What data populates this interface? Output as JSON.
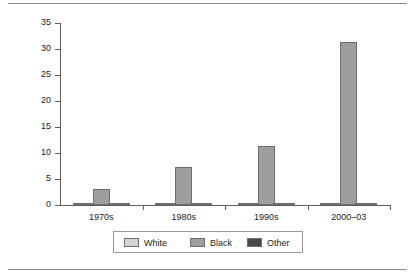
{
  "figure": {
    "name": "grouped-bar-chart"
  },
  "chart_data": {
    "type": "bar",
    "title": "",
    "xlabel": "",
    "ylabel": "",
    "ylim": [
      0,
      35
    ],
    "yticks": [
      0,
      5,
      10,
      15,
      20,
      25,
      30,
      35
    ],
    "ytick_labels": [
      "0",
      "5",
      "10",
      "15",
      "20",
      "25",
      "30",
      "35"
    ],
    "grid": false,
    "legend_position": "bottom",
    "categories": [
      "1970s",
      "1980s",
      "1990s",
      "2000–03"
    ],
    "series": [
      {
        "name": "White",
        "color": "#d4d4d4",
        "values": [
          0.2,
          0.2,
          0.3,
          0.3
        ]
      },
      {
        "name": "Black",
        "color": "#9e9e9e",
        "values": [
          3.1,
          7.3,
          11.3,
          31.3
        ]
      },
      {
        "name": "Other",
        "color": "#4a4a4a",
        "values": [
          0.2,
          0.2,
          0.3,
          0.3
        ]
      }
    ]
  },
  "colors": {
    "axis": "#5d5d5d",
    "bar_edge": "#6e6e6e",
    "rule": "#8a8a8a",
    "text": "#1a1a1a"
  }
}
